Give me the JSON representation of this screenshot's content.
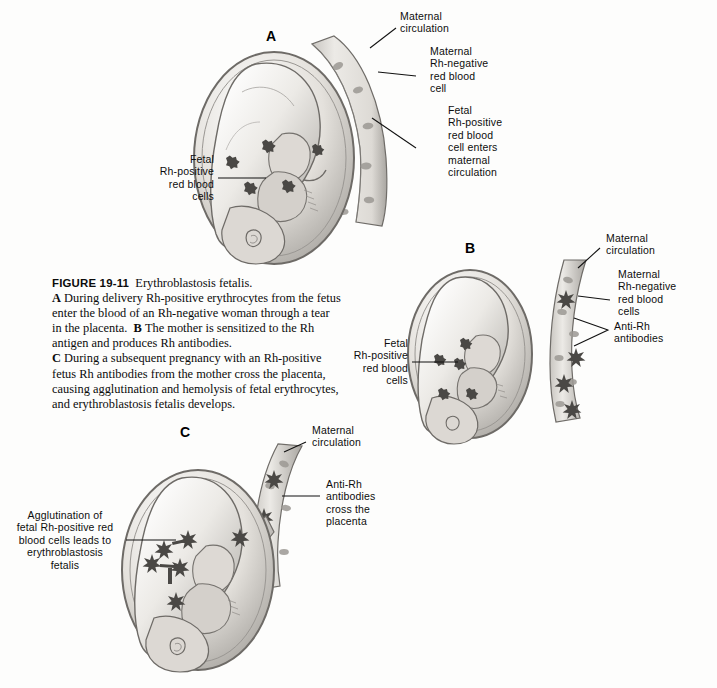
{
  "figure": {
    "caption_label": "FIGURE 19-11",
    "caption_title": "Erythroblastosis fetalis.",
    "caption_a_marker": "A",
    "caption_a_text": "During delivery Rh-positive erythrocytes from the fetus enter the blood of an Rh-negative woman through a tear in the placenta.",
    "caption_b_marker": "B",
    "caption_b_text": "The mother is sensitized to the Rh antigen and produces Rh antibodies.",
    "caption_c_marker": "C",
    "caption_c_text": "During a subsequent pregnancy with an Rh-positive fetus Rh antibodies from the mother cross the placenta, causing agglutination and hemolysis of fetal erythrocytes, and erythroblastosis fetalis develops."
  },
  "panels": {
    "a": {
      "letter": "A",
      "labels": {
        "maternal_circulation": "Maternal\ncirculation",
        "maternal_rh_negative_rbc": "Maternal\nRh-negative\nred blood\ncell",
        "fetal_rh_positive_enters": "Fetal\nRh-positive\nred blood\ncell enters\nmaternal\ncirculation",
        "fetal_rh_positive_cells": "Fetal\nRh-positive\nred blood\ncells"
      }
    },
    "b": {
      "letter": "B",
      "labels": {
        "maternal_circulation": "Maternal\ncirculation",
        "maternal_rh_negative_rbc": "Maternal\nRh-negative\nred blood\ncells",
        "anti_rh_antibodies": "Anti-Rh\nantibodies",
        "fetal_rh_positive_cells": "Fetal\nRh-positive\nred blood\ncells"
      }
    },
    "c": {
      "letter": "C",
      "labels": {
        "maternal_circulation": "Maternal\ncirculation",
        "anti_rh_cross_placenta": "Anti-Rh\nantibodies\ncross the\nplacenta",
        "agglutination": "Agglutination of\nfetal Rh-positive red\nblood cells leads to\nerythroblastosis\nfetalis"
      }
    }
  },
  "colors": {
    "background": "#fdfdfc",
    "ink": "#111111",
    "tissue_light": "#e8e6e2",
    "tissue_mid": "#c9c6c1",
    "tissue_dark": "#8d8a86",
    "cell_dark": "#4a4845",
    "vessel_fill": "#dedbd6"
  }
}
